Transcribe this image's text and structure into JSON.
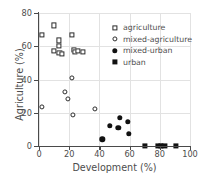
{
  "chart_data": {
    "type": "scatter",
    "title": "",
    "xlabel": "Development (%)",
    "ylabel": "Agriculture (%)",
    "xlim": [
      0,
      100
    ],
    "ylim": [
      0,
      80
    ],
    "xticks": [
      0,
      20,
      40,
      60,
      80,
      100
    ],
    "yticks": [
      0,
      20,
      40,
      60,
      80
    ],
    "grid": true,
    "legend_position": "upper right",
    "series": [
      {
        "name": "agriculture",
        "marker": "open-square",
        "color": "#2b2b2b",
        "points": [
          [
            2,
            67
          ],
          [
            10,
            72.5
          ],
          [
            10,
            57
          ],
          [
            13,
            63.5
          ],
          [
            13,
            60
          ],
          [
            13.5,
            56
          ],
          [
            15,
            55.5
          ],
          [
            22,
            67
          ],
          [
            23,
            58
          ],
          [
            24,
            56.5
          ],
          [
            26,
            57
          ],
          [
            29,
            56.5
          ]
        ]
      },
      {
        "name": "mixed-agriculture",
        "marker": "open-circle",
        "color": "#2b2b2b",
        "points": [
          [
            2,
            23.5
          ],
          [
            17,
            32.5
          ],
          [
            19,
            28.5
          ],
          [
            22,
            41
          ],
          [
            22.5,
            18.5
          ],
          [
            37,
            22.5
          ]
        ]
      },
      {
        "name": "mixed-urban",
        "marker": "filled-circle",
        "color": "#111111",
        "points": [
          [
            42,
            4
          ],
          [
            47,
            12
          ],
          [
            52.5,
            11
          ],
          [
            53.5,
            17
          ],
          [
            59,
            14.5
          ],
          [
            59.5,
            7.5
          ]
        ]
      },
      {
        "name": "urban",
        "marker": "filled-square",
        "color": "#111111",
        "points": [
          [
            70,
            0
          ],
          [
            79,
            0
          ],
          [
            81,
            0
          ],
          [
            83,
            0
          ],
          [
            90.5,
            0
          ]
        ]
      }
    ]
  },
  "legend": {
    "items": [
      {
        "label": "agriculture",
        "marker": "open-square"
      },
      {
        "label": "mixed-agriculture",
        "marker": "open-circle"
      },
      {
        "label": "mixed-urban",
        "marker": "filled-circle"
      },
      {
        "label": "urban",
        "marker": "filled-square"
      }
    ]
  }
}
